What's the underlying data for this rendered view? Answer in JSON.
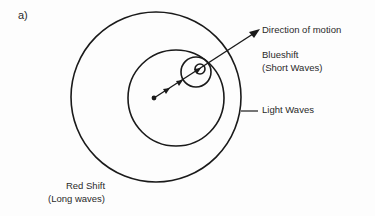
{
  "panel": {
    "label": "a)"
  },
  "labels": {
    "direction_of_motion": "Direction of motion",
    "blueshift_line1": "Blueshift",
    "blueshift_line2": "(Short Waves)",
    "light_waves": "Light Waves",
    "redshift_line1": "Red Shift",
    "redshift_line2": "(Long waves)"
  },
  "diagram": {
    "stroke_color": "#1a1a1a",
    "circles": [
      {
        "name": "outer-wavefront",
        "cx": 156,
        "cy": 97,
        "r": 85
      },
      {
        "name": "middle-wavefront",
        "cx": 176,
        "cy": 98,
        "r": 48
      },
      {
        "name": "inner-wavefront",
        "cx": 196,
        "cy": 72,
        "r": 15
      },
      {
        "name": "innermost-wavefront",
        "cx": 200,
        "cy": 69,
        "r": 5
      }
    ],
    "source_start": {
      "x": 154,
      "y": 98
    },
    "arrow_tip": {
      "x": 260,
      "y": 30
    }
  }
}
